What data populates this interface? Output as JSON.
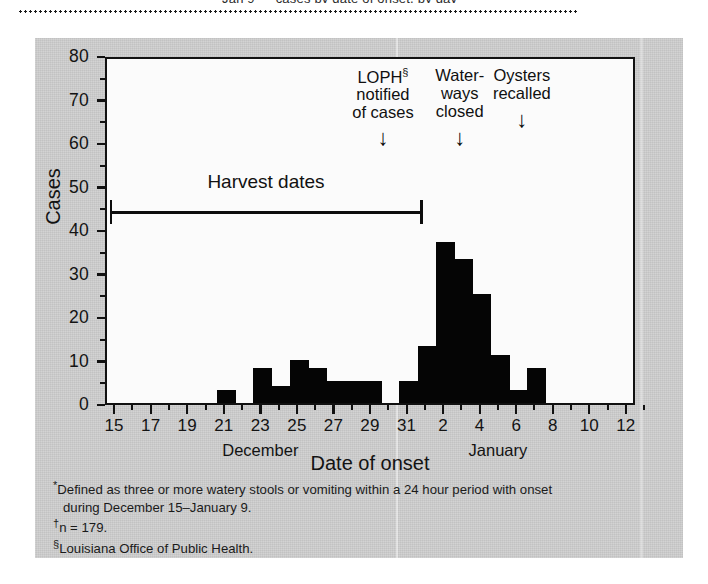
{
  "figure": {
    "caption_sliver": "Jan 9 — cases by date of onset, by day",
    "background_color": "#cfcfcf",
    "bar_color": "#050505",
    "axis_color": "#111111"
  },
  "chart_data": {
    "type": "bar",
    "title": "",
    "xlabel": "Date of onset",
    "ylabel": "Cases",
    "ylim": [
      0,
      80
    ],
    "ytick_step": 10,
    "yticks": [
      0,
      10,
      20,
      30,
      40,
      50,
      60,
      70,
      80
    ],
    "ytick_labels": [
      "0",
      "10",
      "20",
      "30",
      "40",
      "50",
      "60",
      "70",
      "80"
    ],
    "grid": false,
    "legend": "none",
    "x_axis_start_day": 15,
    "x_axis_end_day": 13,
    "xtick_labels": [
      "15",
      "17",
      "19",
      "21",
      "23",
      "25",
      "27",
      "29",
      "31",
      "2",
      "4",
      "6",
      "8",
      "10",
      "12"
    ],
    "month_labels": [
      {
        "text": "December",
        "at_day": 23
      },
      {
        "text": "January",
        "at_day": 36
      }
    ],
    "categories": [
      "Dec 15",
      "Dec 16",
      "Dec 17",
      "Dec 18",
      "Dec 19",
      "Dec 20",
      "Dec 21",
      "Dec 22",
      "Dec 23",
      "Dec 24",
      "Dec 25",
      "Dec 26",
      "Dec 27",
      "Dec 28",
      "Dec 29",
      "Dec 30",
      "Dec 31",
      "Jan 1",
      "Jan 2",
      "Jan 3",
      "Jan 4",
      "Jan 5",
      "Jan 6",
      "Jan 7",
      "Jan 8",
      "Jan 9",
      "Jan 10",
      "Jan 11",
      "Jan 12"
    ],
    "values": [
      0,
      0,
      0,
      0,
      0,
      0,
      3,
      0,
      8,
      4,
      10,
      8,
      5,
      5,
      5,
      0,
      5,
      13,
      37,
      33,
      25,
      11,
      3,
      8,
      0,
      0,
      0,
      0,
      0
    ],
    "annotations": [
      {
        "name": "loph-notified",
        "lines": [
          "LOPH§",
          "notified",
          "of cases"
        ],
        "at_day": 29.6,
        "arrow": "↓"
      },
      {
        "name": "waterways-closed",
        "lines": [
          "Water-",
          "ways",
          "closed"
        ],
        "at_day": 33.8,
        "arrow": "↓"
      },
      {
        "name": "oysters-recalled",
        "lines": [
          "Oysters",
          "recalled"
        ],
        "at_day": 37.2,
        "arrow": "↓"
      }
    ],
    "range_marker": {
      "label": "Harvest dates",
      "start_day": 15.2,
      "end_day": 32.2,
      "value": 45
    }
  },
  "footnotes": [
    {
      "marker": "*",
      "line1": "Defined as three or more watery stools or vomiting within a 24 hour period with onset",
      "line2": "during December 15–January 9."
    },
    {
      "marker": "†",
      "line1": "n = 179.",
      "line2": ""
    },
    {
      "marker": "§",
      "line1": "Louisiana Office of Public Health.",
      "line2": ""
    }
  ]
}
